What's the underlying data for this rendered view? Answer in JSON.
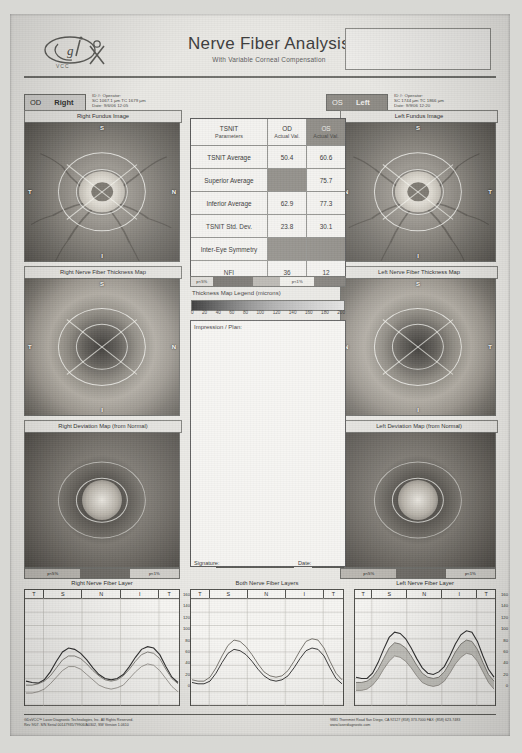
{
  "report": {
    "title": "Nerve Fiber Analysis",
    "subtitle": "With Variable Corneal Compensation",
    "device": "GDx VCC"
  },
  "right_eye": {
    "badge_eye": "OD",
    "badge_side": "Right",
    "meta": [
      "ID #:                     Operator:",
      "SC 1067.1 µm    TC 1679 µm",
      "Date: 9/6/06 12:05"
    ],
    "fundus_caption": "Right Fundus Image",
    "thickness_caption": "Right Nerve Fiber Thickness Map",
    "deviation_caption": "Right Deviation Map (from Normal)",
    "chart_caption": "Right Nerve Fiber Layer",
    "pbar_left": "p<5%",
    "pbar_right": "p<1%"
  },
  "left_eye": {
    "badge_eye": "OS",
    "badge_side": "Left",
    "meta": [
      "ID #:                     Operator:",
      "SC 1744 µm    TC 1866 µm",
      "Date: 9/9/06 12:20"
    ],
    "fundus_caption": "Left Fundus Image",
    "thickness_caption": "Left Nerve Fiber Thickness Map",
    "deviation_caption": "Left Deviation Map (from Normal)",
    "chart_caption": "Left Nerve Fiber Layer",
    "pbar_left": "p<5%",
    "pbar_right": "p<1%"
  },
  "table": {
    "col_param_title": "TSNIT",
    "col_param_sub": "Parameters",
    "col_od_title": "OD",
    "col_od_sub": "Actual Val.",
    "col_os_title": "OS",
    "col_os_sub": "Actual Val.",
    "rows": [
      {
        "label": "TSNIT Average",
        "od": "50.4",
        "os": "60.6",
        "od_shaded": false,
        "os_shaded": false
      },
      {
        "label": "Superior Average",
        "od": "",
        "os": "75.7",
        "od_shaded": true,
        "os_shaded": false
      },
      {
        "label": "Inferior Average",
        "od": "62.9",
        "os": "77.3",
        "od_shaded": false,
        "os_shaded": false
      },
      {
        "label": "TSNIT Std. Dev.",
        "od": "23.8",
        "os": "30.1",
        "od_shaded": false,
        "os_shaded": false
      },
      {
        "label": "Inter-Eye Symmetry",
        "od": "",
        "os": "",
        "od_shaded": true,
        "os_shaded": true
      },
      {
        "label": "NFI",
        "od": "36",
        "os": "12",
        "od_shaded": false,
        "os_shaded": false
      }
    ]
  },
  "legend": {
    "caption": "Thickness Map Legend (microns)",
    "ticks": [
      "0",
      "20",
      "40",
      "60",
      "80",
      "100",
      "120",
      "140",
      "160",
      "180",
      "200"
    ]
  },
  "impression": {
    "label": "Impression / Plan:",
    "signature_label": "Signature:",
    "date_label": "Date:"
  },
  "both_chart": {
    "caption": "Both Nerve Fiber Layers"
  },
  "chart_data": {
    "type": "line",
    "xlabel": "",
    "ylabel": "Thickness (microns)",
    "ylim": [
      0,
      160
    ],
    "yticks": [
      0,
      20,
      40,
      60,
      80,
      100,
      120,
      140,
      160
    ],
    "grid": true,
    "zones": [
      "T",
      "S",
      "N",
      "I",
      "T"
    ],
    "x": [
      0,
      4,
      8,
      12,
      16,
      20,
      24,
      28,
      32,
      36,
      40,
      44,
      48,
      52,
      56,
      60,
      64,
      68,
      72,
      76,
      80,
      84,
      88,
      92,
      96,
      100
    ],
    "panels": [
      {
        "name": "Right Nerve Fiber Layer",
        "series": [
          {
            "name": "OD measured",
            "values": [
              36,
              34,
              33,
              38,
              50,
              66,
              80,
              86,
              84,
              78,
              68,
              56,
              46,
              40,
              38,
              40,
              46,
              58,
              72,
              84,
              88,
              86,
              76,
              58,
              42,
              34
            ]
          },
          {
            "name": "Normative mean",
            "values": [
              30,
              30,
              32,
              36,
              44,
              56,
              68,
              74,
              74,
              70,
              62,
              52,
              44,
              38,
              36,
              38,
              44,
              54,
              66,
              76,
              80,
              78,
              70,
              54,
              40,
              32
            ]
          },
          {
            "name": "Lower bound",
            "values": [
              18,
              18,
              20,
              24,
              32,
              42,
              52,
              58,
              58,
              54,
              46,
              38,
              30,
              26,
              24,
              26,
              30,
              40,
              50,
              58,
              62,
              60,
              52,
              40,
              28,
              20
            ]
          }
        ]
      },
      {
        "name": "Both Nerve Fiber Layers",
        "series": [
          {
            "name": "OD",
            "values": [
              34,
              32,
              32,
              36,
              48,
              64,
              78,
              84,
              82,
              76,
              66,
              54,
              44,
              38,
              36,
              38,
              44,
              56,
              70,
              82,
              86,
              84,
              74,
              56,
              40,
              32
            ]
          },
          {
            "name": "OS",
            "values": [
              38,
              36,
              36,
              42,
              56,
              74,
              90,
              98,
              96,
              88,
              76,
              62,
              50,
              44,
              42,
              44,
              52,
              66,
              82,
              96,
              100,
              98,
              86,
              66,
              48,
              38
            ]
          }
        ]
      },
      {
        "name": "Left Nerve Fiber Layer",
        "series": [
          {
            "name": "OS measured",
            "values": [
              42,
              40,
              40,
              48,
              64,
              84,
              102,
              110,
              108,
              100,
              86,
              70,
              56,
              48,
              46,
              50,
              58,
              74,
              92,
              106,
              112,
              110,
              96,
              74,
              54,
              42
            ]
          },
          {
            "name": "Normative mean",
            "values": [
              34,
              34,
              36,
              42,
              54,
              70,
              86,
              94,
              92,
              86,
              74,
              60,
              48,
              42,
              40,
              42,
              50,
              64,
              80,
              92,
              98,
              96,
              84,
              64,
              46,
              36
            ]
          },
          {
            "name": "Lower bound",
            "values": [
              22,
              22,
              24,
              30,
              40,
              54,
              66,
              74,
              72,
              66,
              56,
              44,
              34,
              30,
              28,
              30,
              36,
              48,
              62,
              72,
              78,
              76,
              66,
              50,
              34,
              24
            ]
          }
        ]
      }
    ]
  },
  "footer": {
    "left_line1": "GDxVCC™ Laser Diagnostic Technologies, Inc. All Rights Reserved.",
    "left_line2": "Rev 9/07. S/N Serial 00147935/79906/A0302, SW Version 1.0610",
    "right_line1": "9881 Thornmint Road   San Diego, CA 92127   (858) 373-7000   FAX: (858) 623-7483",
    "right_line2": "www.laserdiagnostic.com"
  }
}
